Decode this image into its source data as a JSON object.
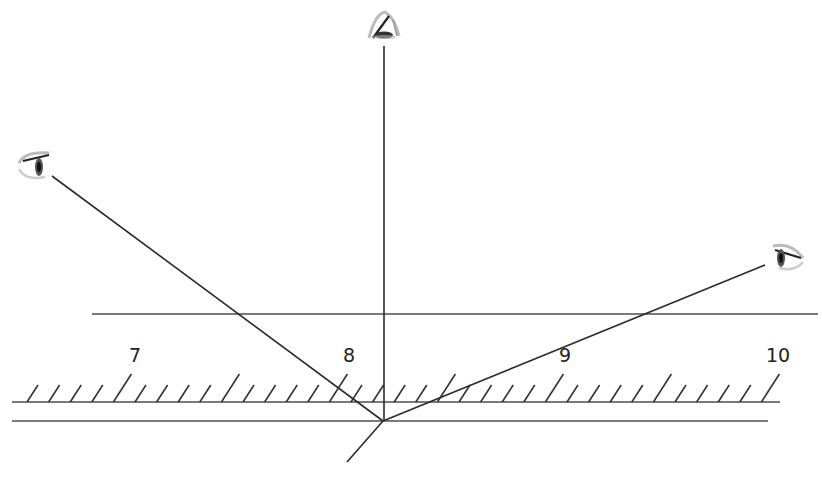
{
  "diagram": {
    "type": "optics-reflection-parallax",
    "colors": {
      "line": "#2a2a2a",
      "rule": "#7a7a7a",
      "background": "#ffffff"
    },
    "scale_labels": [
      "7",
      "8",
      "9",
      "10"
    ],
    "eyes": [
      {
        "name": "top-eye",
        "x": 383,
        "y": 30
      },
      {
        "name": "left-eye",
        "x": 34,
        "y": 166
      },
      {
        "name": "right-eye",
        "x": 787,
        "y": 256
      }
    ],
    "convergence_point": {
      "x": 383,
      "y": 421
    }
  }
}
